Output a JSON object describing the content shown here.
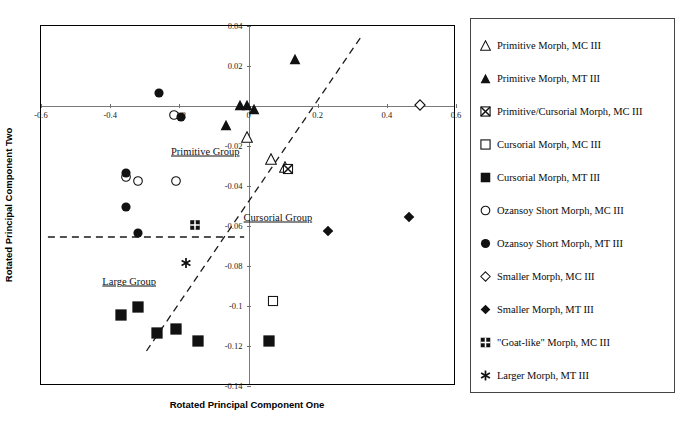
{
  "figure": {
    "x_axis_title": "Rotated Principal Component One",
    "y_axis_title": "Rotated Principal Component Two"
  },
  "annotations": [
    {
      "name": "primitive-group-label",
      "text": "Primitive Group",
      "x": -0.125,
      "y": -0.0225
    },
    {
      "name": "cursorial-group-label",
      "text": "Cursorial Group",
      "x": 0.085,
      "y": -0.0555
    },
    {
      "name": "large-group-label",
      "text": "Large Group",
      "x": -0.345,
      "y": -0.0875
    }
  ],
  "legend": {
    "items": [
      {
        "symbol": "open-triangle",
        "label": "Primitive Morph, MC III"
      },
      {
        "symbol": "filled-triangle",
        "label": "Primitive Morph, MT III"
      },
      {
        "symbol": "crossed-square",
        "label": "Primitive/Cursorial Morph, MC III"
      },
      {
        "symbol": "open-square",
        "label": "Cursorial Morph, MC III"
      },
      {
        "symbol": "filled-square",
        "label": "Cursorial Morph, MT III"
      },
      {
        "symbol": "open-circle",
        "label": "Ozansoy Short Morph, MC III"
      },
      {
        "symbol": "filled-circle",
        "label": "Ozansoy Short Morph, MT III"
      },
      {
        "symbol": "open-diamond",
        "label": "Smaller Morph, MC III"
      },
      {
        "symbol": "filled-diamond",
        "label": "Smaller Morph, MT III"
      },
      {
        "symbol": "goat-square",
        "label": "\"Goat-like\" Morph, MC III"
      },
      {
        "symbol": "asterisk",
        "label": "Larger Morph, MT III"
      }
    ]
  },
  "chart_data": {
    "type": "scatter",
    "title": "",
    "xlabel": "Rotated Principal Component One",
    "ylabel": "Rotated Principal Component Two",
    "xlim": [
      -0.6,
      0.6
    ],
    "ylim": [
      -0.14,
      0.04
    ],
    "xticks": [
      -0.6,
      -0.4,
      -0.2,
      0,
      0.2,
      0.4,
      0.6
    ],
    "xticklabels": [
      "-0.6",
      "-0.4",
      "-0.2",
      "0",
      "0.2",
      "0.4",
      "0.6"
    ],
    "yticks": [
      0.04,
      0.02,
      0,
      -0.02,
      -0.04,
      -0.06,
      -0.08,
      -0.1,
      -0.12,
      -0.14
    ],
    "yticklabels": [
      "0.04",
      "0.02",
      "0",
      "-0.02",
      "-0.04",
      "-0.06",
      "-0.08",
      "-0.1",
      "-0.12",
      "-0.14"
    ],
    "grid": false,
    "legend_position": "right-outside",
    "series": [
      {
        "name": "Primitive Morph, MC III",
        "symbol": "open-triangle",
        "points": [
          [
            -0.005,
            -0.0155
          ],
          [
            0.065,
            -0.0265
          ],
          [
            0.105,
            -0.0305
          ]
        ]
      },
      {
        "name": "Primitive Morph, MT III",
        "symbol": "filled-triangle",
        "points": [
          [
            -0.025,
            0.0005
          ],
          [
            -0.005,
            0.0005
          ],
          [
            0.015,
            -0.0015
          ],
          [
            -0.065,
            -0.0095
          ],
          [
            0.135,
            0.0235
          ]
        ]
      },
      {
        "name": "Primitive/Cursorial Morph, MC III",
        "symbol": "crossed-square",
        "points": [
          [
            0.115,
            -0.0315
          ]
        ]
      },
      {
        "name": "Cursorial Morph, MC III",
        "symbol": "open-square",
        "points": [
          [
            0.07,
            -0.0975
          ]
        ]
      },
      {
        "name": "Cursorial Morph, MT III",
        "symbol": "filled-square",
        "points": [
          [
            -0.37,
            -0.1045
          ],
          [
            -0.32,
            -0.1005
          ],
          [
            -0.265,
            -0.1135
          ],
          [
            -0.21,
            -0.1115
          ],
          [
            -0.145,
            -0.1175
          ],
          [
            0.06,
            -0.1175
          ]
        ]
      },
      {
        "name": "Ozansoy Short Morph, MC III",
        "symbol": "open-circle",
        "points": [
          [
            -0.215,
            -0.0045
          ],
          [
            -0.355,
            -0.0355
          ],
          [
            -0.32,
            -0.0375
          ],
          [
            -0.21,
            -0.0375
          ]
        ]
      },
      {
        "name": "Ozansoy Short Morph, MT III",
        "symbol": "filled-circle",
        "points": [
          [
            -0.26,
            0.0065
          ],
          [
            -0.195,
            -0.0055
          ],
          [
            -0.355,
            -0.0335
          ],
          [
            -0.355,
            -0.0505
          ],
          [
            -0.32,
            -0.0635
          ]
        ]
      },
      {
        "name": "Smaller Morph, MC III",
        "symbol": "open-diamond",
        "points": [
          [
            0.495,
            0.0005
          ]
        ]
      },
      {
        "name": "Smaller Morph, MT III",
        "symbol": "filled-diamond",
        "points": [
          [
            0.23,
            -0.0625
          ],
          [
            0.465,
            -0.0555
          ]
        ]
      },
      {
        "name": "\"Goat-like\" Morph, MC III",
        "symbol": "goat-square",
        "points": [
          [
            -0.155,
            -0.0595
          ]
        ]
      },
      {
        "name": "Larger Morph, MT III",
        "symbol": "asterisk",
        "points": [
          [
            -0.18,
            -0.0785
          ]
        ]
      }
    ],
    "reference_lines": [
      {
        "name": "diagonal-divider",
        "style": "dashed",
        "from": [
          -0.295,
          -0.1225
        ],
        "to": [
          0.325,
          0.0345
        ]
      },
      {
        "name": "horizontal-divider",
        "style": "dashed",
        "from": [
          -0.58,
          -0.0655
        ],
        "to": [
          -0.0125,
          -0.0655
        ]
      }
    ]
  }
}
